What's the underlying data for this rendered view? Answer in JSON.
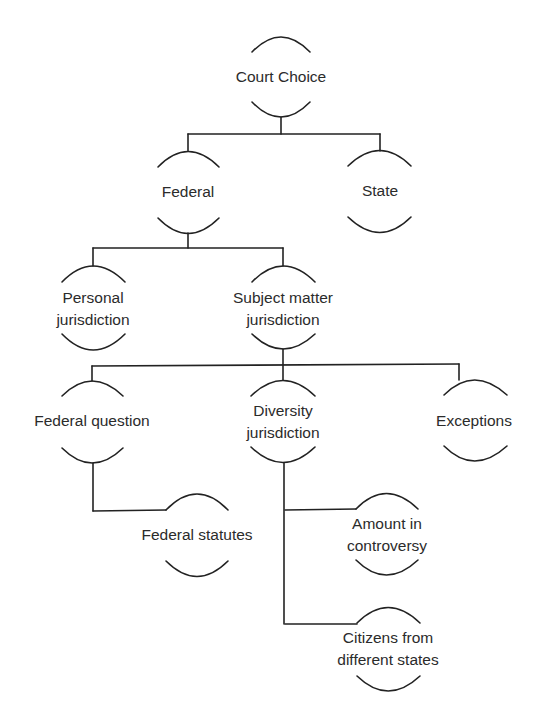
{
  "diagram": {
    "type": "tree",
    "line_color": "#222222",
    "nodes": [
      {
        "id": "court_choice",
        "label": "Court Choice",
        "lines": [
          "Court Choice"
        ],
        "parent": null
      },
      {
        "id": "federal",
        "label": "Federal",
        "lines": [
          "Federal"
        ],
        "parent": "court_choice"
      },
      {
        "id": "state",
        "label": "State",
        "lines": [
          "State"
        ],
        "parent": "court_choice"
      },
      {
        "id": "personal_jurisdiction",
        "label": "Personal jurisdiction",
        "lines": [
          "Personal",
          "jurisdiction"
        ],
        "parent": "federal"
      },
      {
        "id": "subject_matter_jurisdiction",
        "label": "Subject matter jurisdiction",
        "lines": [
          "Subject matter",
          "jurisdiction"
        ],
        "parent": "federal"
      },
      {
        "id": "federal_question",
        "label": "Federal question",
        "lines": [
          "Federal question"
        ],
        "parent": "subject_matter_jurisdiction"
      },
      {
        "id": "diversity_jurisdiction",
        "label": "Diversity jurisdiction",
        "lines": [
          "Diversity",
          "jurisdiction"
        ],
        "parent": "subject_matter_jurisdiction"
      },
      {
        "id": "exceptions",
        "label": "Exceptions",
        "lines": [
          "Exceptions"
        ],
        "parent": "subject_matter_jurisdiction"
      },
      {
        "id": "federal_statutes",
        "label": "Federal statutes",
        "lines": [
          "Federal statutes"
        ],
        "parent": "federal_question"
      },
      {
        "id": "amount_in_controversy",
        "label": "Amount in controversy",
        "lines": [
          "Amount in",
          "controversy"
        ],
        "parent": "diversity_jurisdiction"
      },
      {
        "id": "citizens_from_different_states",
        "label": "Citizens from different states",
        "lines": [
          "Citizens from",
          "different states"
        ],
        "parent": "diversity_jurisdiction"
      }
    ]
  },
  "labels": {
    "court_choice": "Court Choice",
    "federal": "Federal",
    "state": "State",
    "personal_1": "Personal",
    "personal_2": "jurisdiction",
    "subject_1": "Subject matter",
    "subject_2": "jurisdiction",
    "federal_question": "Federal question",
    "diversity_1": "Diversity",
    "diversity_2": "jurisdiction",
    "exceptions": "Exceptions",
    "federal_statutes": "Federal statutes",
    "amount_1": "Amount in",
    "amount_2": "controversy",
    "citizens_1": "Citizens from",
    "citizens_2": "different states"
  }
}
